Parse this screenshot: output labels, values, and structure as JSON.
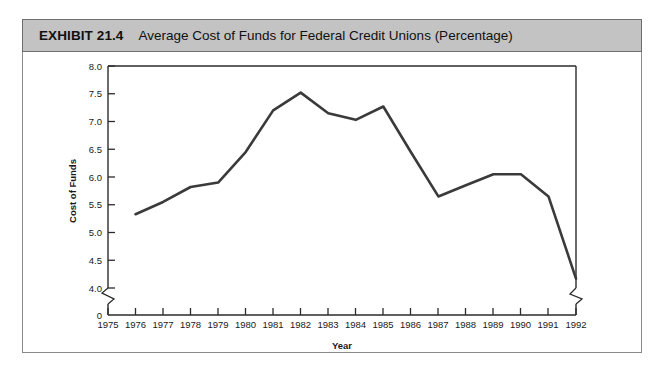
{
  "header": {
    "exhibit_tag": "EXHIBIT 21.4",
    "title": "Average Cost of Funds for Federal Credit Unions (Percentage)"
  },
  "colors": {
    "header_band": "#c3c3c3",
    "header_border": "#6e6e6e",
    "card_border": "#8a8a8a",
    "axis": "#2b2b2b",
    "data_line": "#3a3a3a",
    "background": "#ffffff"
  },
  "chart_data": {
    "type": "line",
    "title": "Average Cost of Funds for Federal Credit Unions (Percentage)",
    "xlabel": "Year",
    "ylabel": "Cost of Funds",
    "x": [
      1976,
      1977,
      1978,
      1979,
      1980,
      1981,
      1982,
      1983,
      1984,
      1985,
      1986,
      1987,
      1988,
      1989,
      1990,
      1991,
      1992
    ],
    "values": [
      5.33,
      5.55,
      5.82,
      5.9,
      6.45,
      7.2,
      7.52,
      7.15,
      7.03,
      7.27,
      6.45,
      5.65,
      5.85,
      6.05,
      6.05,
      5.65,
      4.17
    ],
    "series": [
      {
        "name": "Average Cost of Funds",
        "values": [
          5.33,
          5.55,
          5.82,
          5.9,
          6.45,
          7.2,
          7.52,
          7.15,
          7.03,
          7.27,
          6.45,
          5.65,
          5.85,
          6.05,
          6.05,
          5.65,
          4.17
        ]
      }
    ],
    "x_ticks": [
      "1975",
      "1976",
      "1977",
      "1978",
      "1979",
      "1980",
      "1981",
      "1982",
      "1983",
      "1984",
      "1985",
      "1986",
      "1987",
      "1988",
      "1989",
      "1990",
      "1991",
      "1992"
    ],
    "y_ticks": [
      "8.0",
      "7.5",
      "7.0",
      "6.5",
      "6.0",
      "5.5",
      "5.0",
      "4.5",
      "4.0",
      "0"
    ],
    "y_tick_values": [
      8.0,
      7.5,
      7.0,
      6.5,
      6.0,
      5.5,
      5.0,
      4.5,
      4.0,
      0
    ],
    "ylim": [
      4.0,
      8.0
    ],
    "xlim": [
      1975,
      1992
    ],
    "y_axis_break": true,
    "x_axis_break": true,
    "grid": false,
    "legend": "none"
  }
}
